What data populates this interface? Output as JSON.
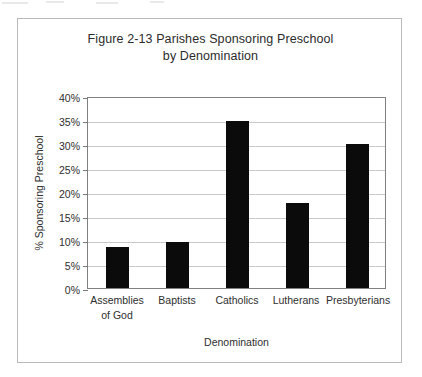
{
  "figure": {
    "title_line1": "Figure 2-13 Parishes Sponsoring Preschool",
    "title_line2": "by Denomination"
  },
  "axes": {
    "y_axis_title": "% Sponsoring Preschool",
    "x_axis_title": "Denomination",
    "y_tick_labels": [
      "40%",
      "35%",
      "30%",
      "25%",
      "20%",
      "15%",
      "10%",
      "5%",
      "0%"
    ]
  },
  "colors": {
    "bar_fill": "#0b0b0b",
    "gridline": "#c9c9c9",
    "plot_border": "#808080",
    "frame_border": "#b9b9b9",
    "text": "#2e2e2e",
    "background": "#ffffff"
  },
  "chart_data": {
    "type": "bar",
    "title": "Figure 2-13 Parishes Sponsoring Preschool by Denomination",
    "xlabel": "Denomination",
    "ylabel": "% Sponsoring Preschool",
    "ylim": [
      0,
      40
    ],
    "ytick_step": 5,
    "ytick_values": [
      0,
      5,
      10,
      15,
      20,
      25,
      30,
      35,
      40
    ],
    "ytick_format": "percent",
    "grid": "horizontal",
    "legend": "none",
    "orientation": "vertical",
    "categories": [
      "Assemblies of God",
      "Baptists",
      "Catholics",
      "Lutherans",
      "Presbyterians"
    ],
    "category_lines": [
      [
        "Assemblies",
        "of God"
      ],
      [
        "Baptists",
        ""
      ],
      [
        "Catholics",
        ""
      ],
      [
        "Lutherans",
        ""
      ],
      [
        "Presbyterians",
        ""
      ]
    ],
    "values": [
      8.5,
      9.6,
      34.8,
      17.7,
      29.9
    ],
    "value_unit": "%",
    "series": [
      {
        "name": "% Sponsoring Preschool",
        "values": [
          8.5,
          9.6,
          34.8,
          17.7,
          29.9
        ],
        "color": "#0b0b0b"
      }
    ],
    "bars": [
      {
        "label": "Assemblies of God",
        "value": 8.5
      },
      {
        "label": "Baptists",
        "value": 9.6
      },
      {
        "label": "Catholics",
        "value": 34.8
      },
      {
        "label": "Lutherans",
        "value": 17.7
      },
      {
        "label": "Presbyterians",
        "value": 29.9
      }
    ]
  }
}
